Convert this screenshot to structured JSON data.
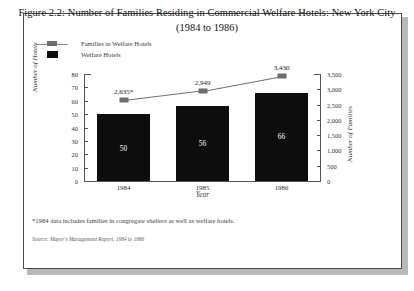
{
  "figure": {
    "title_line1": "Figure 2.2: Number of Families Residing in Commercial Welfare Hotels: New York City",
    "title_line2": "(1984 to 1986)",
    "footnote": "*1984 data includes families in congregate shelters as well as welfare hotels.",
    "source": "Source: Mayor's Management Report, 1984 to 1986"
  },
  "legend": {
    "items": [
      {
        "label": "Families in Welfare Hotels",
        "marker": "line-with-gray-square",
        "color": "#6e6e6e"
      },
      {
        "label": "Welfare Hotels",
        "marker": "black-square",
        "color": "#0d0d0d"
      }
    ]
  },
  "chart_data": {
    "type": "bar",
    "title": "Figure 2.2: Number of Families Residing in Commercial Welfare Hotels: New York City (1984 to 1986)",
    "xlabel": "Year",
    "categories": [
      "1984",
      "1985",
      "1986"
    ],
    "grid": false,
    "legend_position": "top-left",
    "series": [
      {
        "name": "Welfare Hotels",
        "type": "bar",
        "axis": "left",
        "values": [
          50,
          56,
          66
        ],
        "labels": [
          "50",
          "56",
          "66"
        ],
        "color": "#0d0d0d"
      },
      {
        "name": "Families in Welfare Hotels",
        "type": "line",
        "axis": "right",
        "values": [
          2635,
          2949,
          3430
        ],
        "labels": [
          "2,635*",
          "2,949",
          "3,430"
        ],
        "color": "#6e6e6e"
      }
    ],
    "axes": {
      "left": {
        "label": "Number of Hotels",
        "ylim": [
          0,
          80
        ],
        "ticks": [
          0,
          10,
          20,
          30,
          40,
          50,
          60,
          70,
          80
        ],
        "tick_labels": [
          "0",
          "10",
          "20",
          "30",
          "40",
          "50",
          "60",
          "70",
          "80"
        ]
      },
      "right": {
        "label": "Number of Families",
        "ylim": [
          0,
          3500
        ],
        "ticks": [
          0,
          500,
          1000,
          1500,
          2000,
          2500,
          3000,
          3500
        ],
        "tick_labels": [
          "0",
          "500",
          "1,000",
          "1,500",
          "2,000",
          "2,500",
          "3,000",
          "3,500"
        ]
      }
    }
  }
}
